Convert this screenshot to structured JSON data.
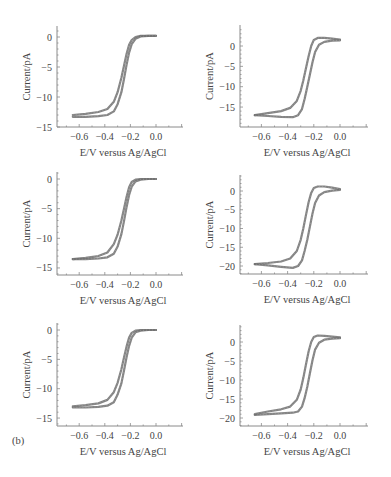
{
  "figure": {
    "panel_tag": "(b)",
    "xlabel": "E/V versus Ag/AgCl",
    "ylabel": "Current/pA",
    "line_color": "#6e6e6e",
    "axis_color": "#8a8a8a"
  },
  "chart_data": [
    {
      "type": "line",
      "position": "row1-left",
      "title": "",
      "xlabel": "E/V versus Ag/AgCl",
      "ylabel": "Current/pA",
      "xticks": [
        -0.6,
        -0.4,
        -0.2,
        0.0
      ],
      "xtick_labels": [
        "−0.6",
        "−0.4",
        "−0.2",
        "0.0"
      ],
      "yticks": [
        0,
        -5,
        -10,
        -15
      ],
      "ytick_labels": [
        "0",
        "−5",
        "−10",
        "−15"
      ],
      "xlim": [
        -0.77,
        0.21
      ],
      "ylim": [
        -15,
        2
      ],
      "grid": false,
      "series": [
        {
          "name": "forward scan",
          "x": [
            -0.65,
            -0.55,
            -0.45,
            -0.38,
            -0.33,
            -0.3,
            -0.27,
            -0.25,
            -0.23,
            -0.21,
            -0.19,
            -0.16,
            -0.12,
            -0.06,
            0.0
          ],
          "y": [
            -13.0,
            -12.8,
            -12.5,
            -12.0,
            -10.8,
            -9.2,
            -6.8,
            -4.8,
            -2.8,
            -1.3,
            -0.5,
            0.0,
            0.2,
            0.2,
            0.2
          ]
        },
        {
          "name": "reverse scan",
          "x": [
            0.0,
            -0.06,
            -0.12,
            -0.16,
            -0.19,
            -0.21,
            -0.23,
            -0.25,
            -0.27,
            -0.3,
            -0.33,
            -0.38,
            -0.45,
            -0.55,
            -0.65
          ],
          "y": [
            0.2,
            0.2,
            0.1,
            -0.3,
            -1.2,
            -2.6,
            -4.6,
            -7.0,
            -9.2,
            -11.2,
            -12.4,
            -13.0,
            -13.2,
            -13.3,
            -13.3
          ]
        }
      ]
    },
    {
      "type": "line",
      "position": "row1-right",
      "title": "",
      "xlabel": "E/V versus Ag/AgCl",
      "ylabel": "Current/pA",
      "xticks": [
        -0.6,
        -0.4,
        -0.2,
        0.0
      ],
      "xtick_labels": [
        "−0.6",
        "−0.4",
        "−0.2",
        "0.0"
      ],
      "yticks": [
        0,
        -5,
        -10,
        -15
      ],
      "ytick_labels": [
        "0",
        "−5",
        "−10",
        "−15"
      ],
      "xlim": [
        -0.78,
        0.21
      ],
      "ylim": [
        -20,
        4.5
      ],
      "grid": false,
      "series": [
        {
          "name": "forward scan",
          "x": [
            -0.65,
            -0.55,
            -0.45,
            -0.38,
            -0.33,
            -0.3,
            -0.28,
            -0.26,
            -0.24,
            -0.22,
            -0.2,
            -0.17,
            -0.12,
            -0.06,
            0.0
          ],
          "y": [
            -17.0,
            -16.5,
            -16.0,
            -15.2,
            -13.5,
            -11.0,
            -8.5,
            -5.5,
            -2.5,
            0.0,
            1.5,
            2.0,
            2.0,
            1.8,
            1.6
          ]
        },
        {
          "name": "reverse scan",
          "x": [
            0.0,
            -0.06,
            -0.12,
            -0.16,
            -0.19,
            -0.21,
            -0.23,
            -0.25,
            -0.27,
            -0.29,
            -0.32,
            -0.36,
            -0.45,
            -0.55,
            -0.65
          ],
          "y": [
            1.4,
            1.3,
            1.0,
            0.3,
            -1.5,
            -4.0,
            -7.0,
            -10.0,
            -13.0,
            -15.5,
            -17.0,
            -17.5,
            -17.4,
            -17.2,
            -17.0
          ]
        }
      ]
    },
    {
      "type": "line",
      "position": "row2-left",
      "title": "",
      "xlabel": "E/V versus Ag/AgCl",
      "ylabel": "Current/pA",
      "xticks": [
        -0.6,
        -0.4,
        -0.2,
        0.0
      ],
      "xtick_labels": [
        "−0.6",
        "−0.4",
        "−0.2",
        "0.0"
      ],
      "yticks": [
        0,
        -5,
        -10,
        -15
      ],
      "ytick_labels": [
        "0",
        "−5",
        "−10",
        "−15"
      ],
      "xlim": [
        -0.77,
        0.21
      ],
      "ylim": [
        -16,
        1
      ],
      "grid": false,
      "series": [
        {
          "name": "forward scan",
          "x": [
            -0.65,
            -0.55,
            -0.45,
            -0.38,
            -0.33,
            -0.3,
            -0.27,
            -0.25,
            -0.23,
            -0.21,
            -0.19,
            -0.16,
            -0.12,
            -0.06,
            0.0
          ],
          "y": [
            -13.5,
            -13.3,
            -13.0,
            -12.4,
            -11.0,
            -9.4,
            -7.0,
            -5.0,
            -3.0,
            -1.4,
            -0.5,
            -0.1,
            0.0,
            0.0,
            0.0
          ]
        },
        {
          "name": "reverse scan",
          "x": [
            0.0,
            -0.06,
            -0.12,
            -0.16,
            -0.19,
            -0.21,
            -0.23,
            -0.25,
            -0.27,
            -0.3,
            -0.33,
            -0.38,
            -0.45,
            -0.55,
            -0.65
          ],
          "y": [
            0.0,
            0.0,
            -0.1,
            -0.4,
            -1.3,
            -2.7,
            -4.7,
            -7.1,
            -9.3,
            -11.4,
            -12.6,
            -13.2,
            -13.4,
            -13.5,
            -13.5
          ]
        }
      ]
    },
    {
      "type": "line",
      "position": "row2-right",
      "title": "",
      "xlabel": "E/V versus Ag/AgCl",
      "ylabel": "Current/pA",
      "xticks": [
        -0.6,
        -0.4,
        -0.2,
        0.0
      ],
      "xtick_labels": [
        "−0.6",
        "−0.4",
        "−0.2",
        "0.0"
      ],
      "yticks": [
        0,
        -5,
        -10,
        -15,
        -20
      ],
      "ytick_labels": [
        "0",
        "−5",
        "−10",
        "−15",
        "−20"
      ],
      "xlim": [
        -0.78,
        0.21
      ],
      "ylim": [
        -22.5,
        5
      ],
      "grid": false,
      "series": [
        {
          "name": "forward scan",
          "x": [
            -0.65,
            -0.55,
            -0.45,
            -0.38,
            -0.33,
            -0.3,
            -0.28,
            -0.26,
            -0.24,
            -0.22,
            -0.2,
            -0.17,
            -0.12,
            -0.06,
            0.0
          ],
          "y": [
            -19.5,
            -19.2,
            -18.8,
            -18.0,
            -16.0,
            -13.0,
            -10.0,
            -6.5,
            -3.0,
            -0.5,
            0.8,
            1.2,
            1.2,
            0.9,
            0.5
          ]
        },
        {
          "name": "reverse scan",
          "x": [
            0.0,
            -0.06,
            -0.12,
            -0.16,
            -0.19,
            -0.21,
            -0.23,
            -0.25,
            -0.27,
            -0.29,
            -0.32,
            -0.36,
            -0.45,
            -0.55,
            -0.65
          ],
          "y": [
            0.3,
            0.1,
            -0.3,
            -1.2,
            -3.2,
            -6.0,
            -9.5,
            -13.0,
            -16.0,
            -18.5,
            -20.0,
            -20.5,
            -20.2,
            -19.8,
            -19.5
          ]
        }
      ]
    },
    {
      "type": "line",
      "position": "row3-left",
      "title": "",
      "xlabel": "E/V versus Ag/AgCl",
      "ylabel": "Current/pA",
      "xticks": [
        -0.6,
        -0.4,
        -0.2,
        0.0
      ],
      "xtick_labels": [
        "−0.6",
        "−0.4",
        "−0.2",
        "0.0"
      ],
      "yticks": [
        0,
        -5,
        -10,
        -15
      ],
      "ytick_labels": [
        "0",
        "−5",
        "−10",
        "−15"
      ],
      "xlim": [
        -0.77,
        0.21
      ],
      "ylim": [
        -16,
        1
      ],
      "grid": false,
      "series": [
        {
          "name": "forward scan",
          "x": [
            -0.65,
            -0.55,
            -0.45,
            -0.38,
            -0.33,
            -0.3,
            -0.27,
            -0.25,
            -0.23,
            -0.21,
            -0.19,
            -0.16,
            -0.12,
            -0.06,
            0.0
          ],
          "y": [
            -13.0,
            -12.8,
            -12.5,
            -11.9,
            -10.6,
            -9.0,
            -6.7,
            -4.7,
            -2.8,
            -1.3,
            -0.5,
            -0.1,
            0.0,
            0.0,
            0.0
          ]
        },
        {
          "name": "reverse scan",
          "x": [
            0.0,
            -0.06,
            -0.12,
            -0.16,
            -0.19,
            -0.21,
            -0.23,
            -0.25,
            -0.27,
            -0.3,
            -0.33,
            -0.38,
            -0.45,
            -0.55,
            -0.65
          ],
          "y": [
            0.0,
            0.0,
            -0.1,
            -0.4,
            -1.3,
            -2.7,
            -4.6,
            -6.9,
            -9.1,
            -11.0,
            -12.3,
            -12.9,
            -13.1,
            -13.2,
            -13.2
          ]
        }
      ]
    },
    {
      "type": "line",
      "position": "row3-right",
      "title": "",
      "xlabel": "E/V versus Ag/AgCl",
      "ylabel": "Current/pA",
      "xticks": [
        -0.6,
        -0.4,
        -0.2,
        0.0
      ],
      "xtick_labels": [
        "−0.6",
        "−0.4",
        "−0.2",
        "0.0"
      ],
      "yticks": [
        0,
        -5,
        -10,
        -15,
        -20
      ],
      "ytick_labels": [
        "0",
        "−5",
        "−10",
        "−15",
        "−20"
      ],
      "xlim": [
        -0.78,
        0.21
      ],
      "ylim": [
        -22.5,
        5
      ],
      "grid": false,
      "series": [
        {
          "name": "forward scan",
          "x": [
            -0.65,
            -0.55,
            -0.45,
            -0.38,
            -0.33,
            -0.3,
            -0.28,
            -0.26,
            -0.24,
            -0.22,
            -0.2,
            -0.17,
            -0.12,
            -0.06,
            0.0
          ],
          "y": [
            -19.0,
            -18.3,
            -17.7,
            -17.0,
            -15.2,
            -12.5,
            -9.5,
            -6.0,
            -2.5,
            0.0,
            1.3,
            1.7,
            1.6,
            1.4,
            1.2
          ]
        },
        {
          "name": "reverse scan",
          "x": [
            0.0,
            -0.06,
            -0.12,
            -0.16,
            -0.19,
            -0.21,
            -0.23,
            -0.25,
            -0.27,
            -0.29,
            -0.32,
            -0.36,
            -0.45,
            -0.55,
            -0.65
          ],
          "y": [
            1.0,
            0.9,
            0.6,
            -0.2,
            -2.0,
            -4.8,
            -8.2,
            -11.8,
            -14.8,
            -17.0,
            -18.3,
            -18.6,
            -18.8,
            -19.0,
            -19.2
          ]
        }
      ]
    }
  ],
  "layout": {
    "panels": [
      {
        "axis_x0": 57,
        "axis_x1": 183,
        "axis_y": 127,
        "plot_top": 26,
        "x_at_0": 156,
        "x_per_v": 128,
        "y_at_0": 37,
        "y_per_unit": 6.0
      },
      {
        "axis_x0": 240,
        "axis_x1": 368,
        "axis_y": 127,
        "plot_top": 25,
        "x_at_0": 340,
        "x_per_v": 131,
        "y_at_0": 46,
        "y_per_unit": 4.07
      },
      {
        "axis_x0": 57,
        "axis_x1": 183,
        "axis_y": 275,
        "plot_top": 172,
        "x_at_0": 156,
        "x_per_v": 128,
        "y_at_0": 179,
        "y_per_unit": 5.93
      },
      {
        "axis_x0": 240,
        "axis_x1": 368,
        "axis_y": 274,
        "plot_top": 175,
        "x_at_0": 340,
        "x_per_v": 131,
        "y_at_0": 191,
        "y_per_unit": 3.75
      },
      {
        "axis_x0": 57,
        "axis_x1": 183,
        "axis_y": 426,
        "plot_top": 323,
        "x_at_0": 156,
        "x_per_v": 128,
        "y_at_0": 330,
        "y_per_unit": 5.87
      },
      {
        "axis_x0": 240,
        "axis_x1": 368,
        "axis_y": 426,
        "plot_top": 325,
        "x_at_0": 340,
        "x_per_v": 131,
        "y_at_0": 342,
        "y_per_unit": 3.8
      }
    ],
    "panel_tag_pos": [
      12,
      444
    ]
  }
}
